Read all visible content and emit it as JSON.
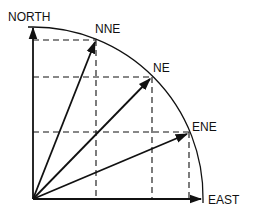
{
  "diagram": {
    "labels": {
      "north": "NORTH",
      "nne": "NNE",
      "ne": "NE",
      "ene": "ENE",
      "east": "EAST"
    },
    "vectors": [
      {
        "name": "NORTH",
        "angle_deg": 90
      },
      {
        "name": "NNE",
        "angle_deg": 67.5
      },
      {
        "name": "NE",
        "angle_deg": 45
      },
      {
        "name": "ENE",
        "angle_deg": 22.5
      },
      {
        "name": "EAST",
        "angle_deg": 0
      }
    ],
    "colors": {
      "stroke": "#111111",
      "background": "#ffffff"
    }
  }
}
